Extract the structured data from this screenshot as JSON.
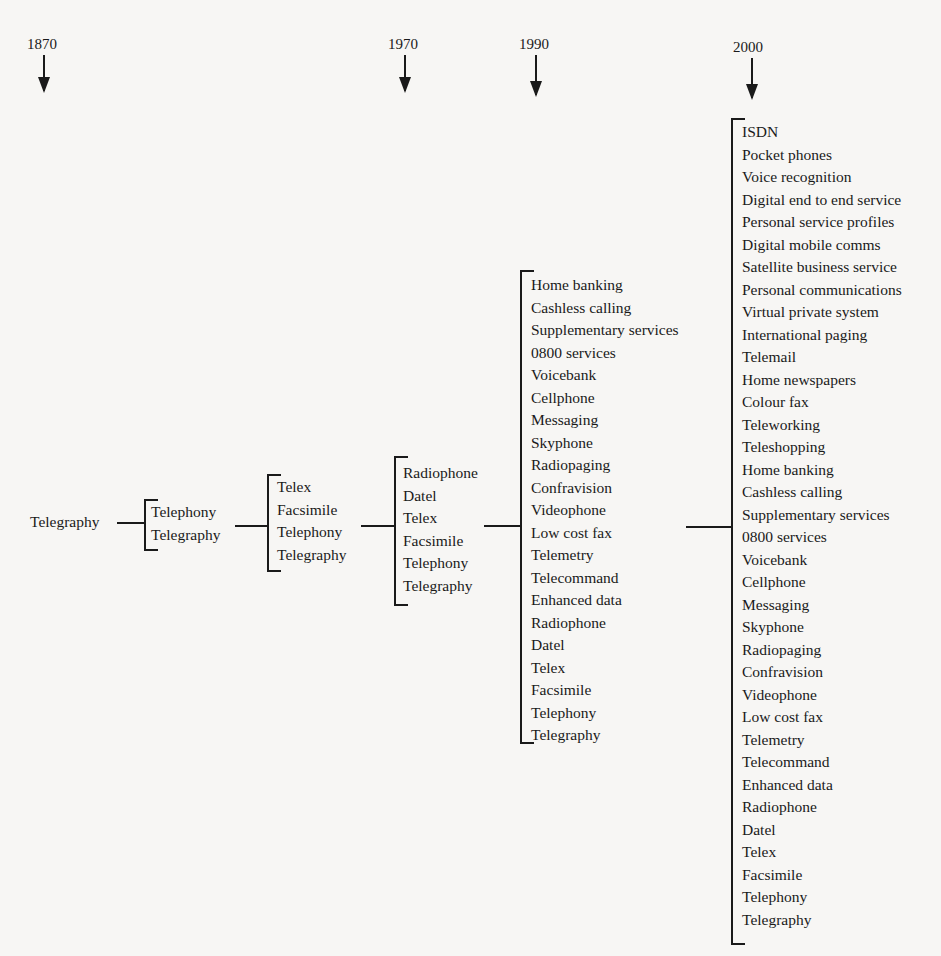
{
  "years": [
    "1870",
    "1970",
    "1990",
    "2000"
  ],
  "root": "Telegraphy",
  "columns": [
    {
      "label": "stage-1",
      "items": [
        "Telephony",
        "Telegraphy"
      ]
    },
    {
      "label": "stage-2",
      "items": [
        "Telex",
        "Facsimile",
        "Telephony",
        "Telegraphy"
      ]
    },
    {
      "label": "1970",
      "items": [
        "Radiophone",
        "Datel",
        "Telex",
        "Facsimile",
        "Telephony",
        "Telegraphy"
      ]
    },
    {
      "label": "1990",
      "items": [
        "Home banking",
        "Cashless calling",
        "Supplementary services",
        "0800 services",
        "Voicebank",
        "Cellphone",
        "Messaging",
        "Skyphone",
        "Radiopaging",
        "Confravision",
        "Videophone",
        "Low cost fax",
        "Telemetry",
        "Telecommand",
        "Enhanced data",
        "Radiophone",
        "Datel",
        "Telex",
        "Facsimile",
        "Telephony",
        "Telegraphy"
      ]
    },
    {
      "label": "2000",
      "items": [
        "ISDN",
        "Pocket phones",
        "Voice recognition",
        "Digital end to end service",
        "Personal service profiles",
        "Digital mobile comms",
        "Satellite business service",
        "Personal communications",
        "Virtual private system",
        "International paging",
        "Telemail",
        "Home newspapers",
        "Colour fax",
        "Teleworking",
        "Teleshopping",
        "Home banking",
        "Cashless calling",
        "Supplementary services",
        "0800 services",
        "Voicebank",
        "Cellphone",
        "Messaging",
        "Skyphone",
        "Radiopaging",
        "Confravision",
        "Videophone",
        "Low cost fax",
        "Telemetry",
        "Telecommand",
        "Enhanced data",
        "Radiophone",
        "Datel",
        "Telex",
        "Facsimile",
        "Telephony",
        "Telegraphy"
      ]
    }
  ]
}
